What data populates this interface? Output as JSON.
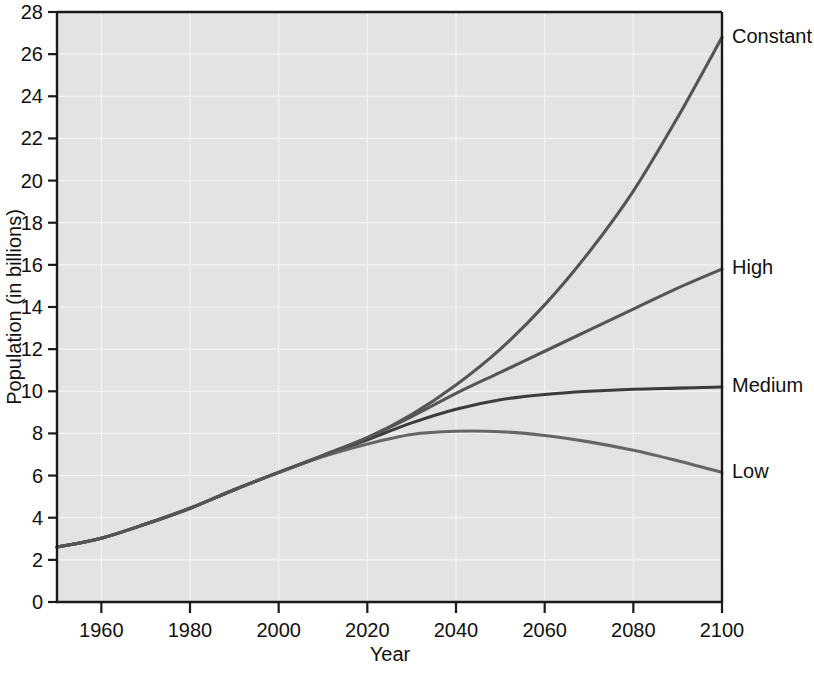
{
  "chart_data": {
    "type": "line",
    "title": "",
    "xlabel": "Year",
    "ylabel": "Population (in billions)",
    "xlim": [
      1950,
      2100
    ],
    "ylim": [
      0,
      28
    ],
    "xticks": [
      1960,
      1980,
      2000,
      2020,
      2040,
      2060,
      2080,
      2100
    ],
    "yticks": [
      0,
      2,
      4,
      6,
      8,
      10,
      12,
      14,
      16,
      18,
      20,
      22,
      24,
      26,
      28
    ],
    "grid": true,
    "legend_position": "right-of-line-ends",
    "x": [
      1950,
      1960,
      1970,
      1980,
      1990,
      2000,
      2010,
      2020,
      2030,
      2040,
      2050,
      2060,
      2070,
      2080,
      2090,
      2100
    ],
    "series": [
      {
        "name": "Constant",
        "label": "Constant",
        "color": "#555555",
        "values": [
          2.6,
          3.03,
          3.7,
          4.45,
          5.33,
          6.15,
          6.96,
          7.8,
          8.9,
          10.3,
          12.0,
          14.1,
          16.6,
          19.5,
          23.0,
          26.8
        ]
      },
      {
        "name": "High",
        "label": "High",
        "color": "#555555",
        "values": [
          2.6,
          3.03,
          3.7,
          4.45,
          5.33,
          6.15,
          6.96,
          7.8,
          8.8,
          9.9,
          10.9,
          11.9,
          12.9,
          13.9,
          14.9,
          15.8
        ]
      },
      {
        "name": "Medium",
        "label": "Medium",
        "color": "#3c3c3c",
        "values": [
          2.6,
          3.03,
          3.7,
          4.45,
          5.33,
          6.15,
          6.93,
          7.7,
          8.5,
          9.15,
          9.6,
          9.85,
          10.0,
          10.1,
          10.15,
          10.2
        ]
      },
      {
        "name": "Low",
        "label": "Low",
        "color": "#666666",
        "values": [
          2.6,
          3.03,
          3.7,
          4.45,
          5.33,
          6.15,
          6.9,
          7.5,
          7.95,
          8.1,
          8.08,
          7.9,
          7.6,
          7.2,
          6.7,
          6.15
        ]
      }
    ]
  },
  "axis": {
    "y_title": "Population (in billions)",
    "x_title": "Year",
    "y_tick_labels": [
      "0",
      "2",
      "4",
      "6",
      "8",
      "10",
      "12",
      "14",
      "16",
      "18",
      "20",
      "22",
      "24",
      "26",
      "28"
    ],
    "x_tick_labels": [
      "1960",
      "1980",
      "2000",
      "2020",
      "2040",
      "2060",
      "2080",
      "2100"
    ]
  },
  "labels": {
    "constant": "Constant",
    "high": "High",
    "medium": "Medium",
    "low": "Low"
  },
  "colors": {
    "plot_background": "#e3e3e3",
    "grid": "#f4f4f4",
    "axis": "#1a1a1a",
    "page_background": "#ffffff",
    "text": "#111111"
  }
}
